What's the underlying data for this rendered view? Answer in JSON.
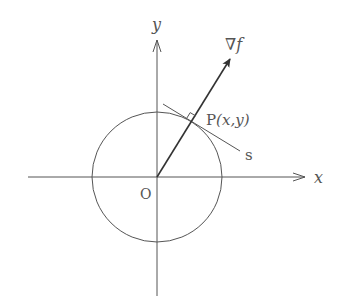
{
  "diagram": {
    "labels": {
      "y_axis": "y",
      "x_axis": "x",
      "origin": "O",
      "gradient": "∇f",
      "point": "P(x,y)",
      "point_prefix": "P",
      "point_coords": "(x,y)",
      "tangent": "s"
    },
    "geometry": {
      "origin": [
        157,
        177
      ],
      "circle_radius": 65,
      "point_P": [
        192,
        122
      ],
      "gradient_tip": [
        230,
        59
      ],
      "tangent_start": [
        163,
        104
      ],
      "tangent_end": [
        240,
        151
      ]
    },
    "colors": {
      "line": "#555555",
      "arrow": "#333333",
      "background": "#ffffff"
    }
  }
}
